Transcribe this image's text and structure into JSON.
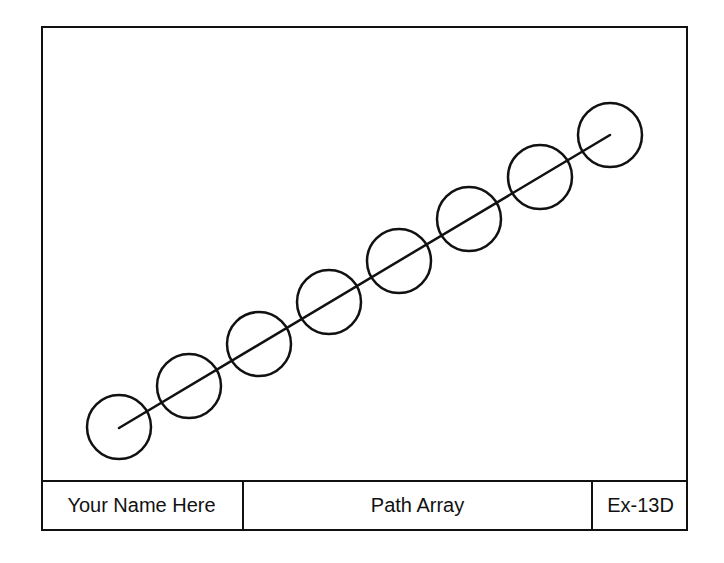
{
  "drawing": {
    "stroke_color": "#111111",
    "background_color": "#ffffff",
    "path_line": {
      "x1": 119,
      "y1": 428,
      "x2": 610,
      "y2": 135
    },
    "circle_radius": 32,
    "circles": [
      {
        "cx": 119,
        "cy": 427
      },
      {
        "cx": 189,
        "cy": 386
      },
      {
        "cx": 259,
        "cy": 344
      },
      {
        "cx": 329,
        "cy": 302
      },
      {
        "cx": 399,
        "cy": 261
      },
      {
        "cx": 469,
        "cy": 219
      },
      {
        "cx": 540,
        "cy": 177
      },
      {
        "cx": 610,
        "cy": 135
      }
    ]
  },
  "title_block": {
    "name": "Your Name Here",
    "title": "Path Array",
    "number": "Ex-13D"
  }
}
